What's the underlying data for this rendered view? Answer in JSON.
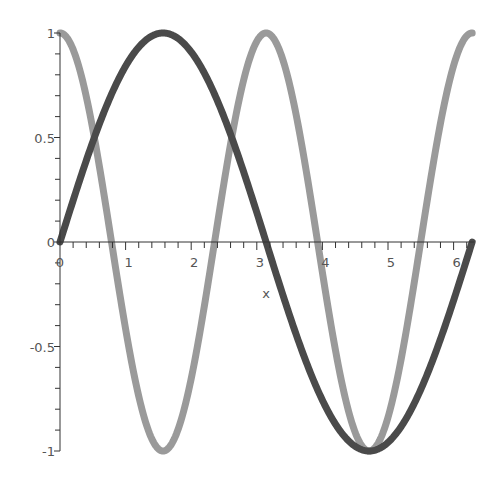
{
  "chart_data": {
    "type": "line",
    "title": "",
    "xlabel": "x",
    "ylabel": "",
    "xlim": [
      0,
      6.2832
    ],
    "ylim": [
      -1,
      1
    ],
    "grid": false,
    "legend": null,
    "x_ticks": [
      "0",
      "1",
      "2",
      "3",
      "4",
      "5",
      "6"
    ],
    "y_ticks": [
      "1",
      "0.5",
      "0",
      "-0.5",
      "-1"
    ],
    "series": [
      {
        "name": "sin(x)",
        "color": "#4a4a4a",
        "x": [
          0,
          0.5236,
          1.0472,
          1.5708,
          2.0944,
          2.618,
          3.1416,
          3.6652,
          4.1888,
          4.7124,
          5.236,
          5.7596,
          6.2832
        ],
        "values": [
          0,
          0.5,
          0.866,
          1,
          0.866,
          0.5,
          0,
          -0.5,
          -0.866,
          -1,
          -0.866,
          -0.5,
          0
        ]
      },
      {
        "name": "cos(2x)",
        "color": "#9a9a9a",
        "x": [
          0,
          0.5236,
          1.0472,
          1.5708,
          2.0944,
          2.618,
          3.1416,
          3.6652,
          4.1888,
          4.7124,
          5.236,
          5.7596,
          6.2832
        ],
        "values": [
          1,
          0.5,
          -0.5,
          -1,
          -0.5,
          0.5,
          1,
          0.5,
          -0.5,
          -1,
          -0.5,
          0.5,
          1
        ]
      }
    ]
  }
}
